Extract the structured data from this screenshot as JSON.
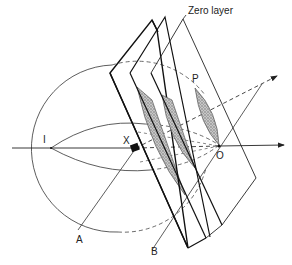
{
  "diagram": {
    "labels": {
      "zero_layer": "Zero layer",
      "point_p": "P",
      "point_i": "I",
      "point_x": "X",
      "point_o": "O",
      "line_a": "A",
      "line_b": "B"
    },
    "colors": {
      "line": "#222222",
      "shading": "#9a9a9a",
      "background": "#ffffff"
    }
  }
}
